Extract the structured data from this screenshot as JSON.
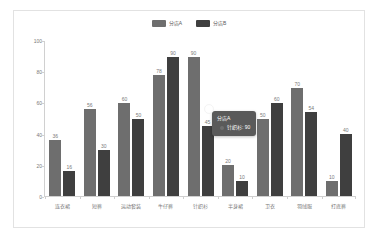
{
  "chart_data": {
    "type": "bar",
    "title": "",
    "subtitle": "",
    "xlabel": "",
    "ylabel": "",
    "ylim": [
      0,
      100
    ],
    "yticks": [
      0,
      20,
      40,
      60,
      80,
      100
    ],
    "grid": false,
    "legend_position": "top-center",
    "categories": [
      "连衣裙",
      "短裤",
      "运动套装",
      "牛仔裤",
      "针织衫",
      "半身裙",
      "卫衣",
      "羽绒服",
      "打底裤"
    ],
    "series": [
      {
        "name": "分店A",
        "color": "#6e6e6e",
        "values": [
          36,
          56,
          60,
          78,
          90,
          20,
          50,
          70,
          10
        ]
      },
      {
        "name": "分店B",
        "color": "#3f3f3f",
        "values": [
          16,
          30,
          50,
          90,
          45,
          10,
          60,
          54,
          40
        ]
      }
    ]
  },
  "legend": {
    "items": [
      {
        "label": "分店A",
        "color": "#6e6e6e"
      },
      {
        "label": "分店B",
        "color": "#3f3f3f"
      }
    ]
  },
  "tooltip": {
    "title": "分店A",
    "series_color": "#6e6e6e",
    "row": "针织衫: 90",
    "visible": true
  }
}
